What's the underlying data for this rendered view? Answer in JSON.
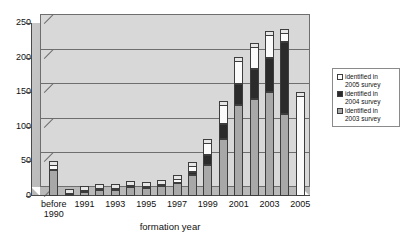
{
  "chart_data": {
    "type": "bar",
    "subtype": "stacked-column-3d",
    "title": "",
    "xlabel": "formation year",
    "ylabel": "",
    "ylim": [
      0,
      250
    ],
    "yticks": [
      0,
      50,
      100,
      150,
      200,
      250
    ],
    "grid": true,
    "legend_position": "right",
    "categories": [
      "before 1990",
      "1990",
      "1991",
      "1992",
      "1993",
      "1994",
      "1995",
      "1996",
      "1997",
      "1998",
      "1999",
      "2000",
      "2001",
      "2002",
      "2003",
      "2004",
      "2005"
    ],
    "tick_labels": [
      "before 1990",
      "",
      "1991",
      "",
      "1993",
      "",
      "1995",
      "",
      "1997",
      "",
      "1999",
      "",
      "2001",
      "",
      "2003",
      "",
      "2005"
    ],
    "series": [
      {
        "name": "identified in 2003 survey",
        "color": "#a8a8a8",
        "values": [
          37,
          4,
          6,
          9,
          9,
          13,
          12,
          15,
          19,
          30,
          45,
          82,
          132,
          140,
          150,
          118,
          0
        ]
      },
      {
        "name": "identified in 2004 survey",
        "color": "#2b2b2b",
        "values": [
          0,
          0,
          0,
          0,
          0,
          0,
          0,
          0,
          0,
          4,
          14,
          22,
          30,
          44,
          50,
          105,
          0
        ]
      },
      {
        "name": "identified in 2005 survey",
        "color": "#ffffff",
        "values": [
          8,
          1,
          2,
          2,
          2,
          3,
          3,
          3,
          6,
          10,
          18,
          28,
          33,
          32,
          33,
          13,
          145
        ]
      }
    ],
    "totals": [
      45,
      5,
      8,
      11,
      11,
      16,
      15,
      18,
      25,
      44,
      77,
      132,
      195,
      216,
      233,
      236,
      145
    ]
  },
  "legend": {
    "items": [
      {
        "label_line1": "identified in",
        "label_line2": "2005 survey",
        "swatch": "white"
      },
      {
        "label_line1": "identified in",
        "label_line2": "2004 survey",
        "swatch": "black"
      },
      {
        "label_line1": "identified in",
        "label_line2": "2003 survey",
        "swatch": "gray"
      }
    ]
  },
  "axis": {
    "x_title": "formation year"
  }
}
